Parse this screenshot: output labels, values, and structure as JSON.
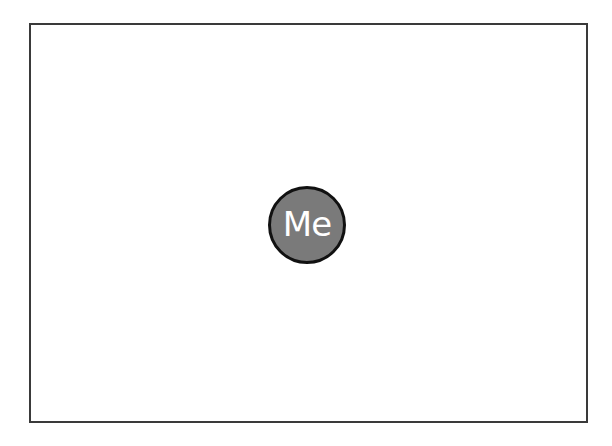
{
  "diagram": {
    "node": {
      "label": "Me",
      "fill_color": "#7a7a7a",
      "border_color": "#111111",
      "text_color": "#ffffff"
    },
    "frame": {
      "border_color": "#3a3a3a"
    }
  }
}
